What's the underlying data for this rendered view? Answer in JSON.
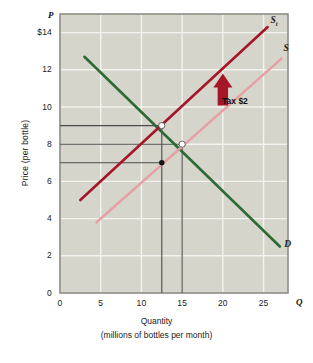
{
  "figure": {
    "axis_letters": {
      "y": "P",
      "x": "Q"
    },
    "y_axis_title": "Price (per bottle)",
    "x_axis_title": "Quantity",
    "x_axis_subtitle": "(millions of bottles per month)"
  },
  "colors": {
    "demand": "#2e6b33",
    "supply_tax": "#a51728",
    "supply": "#e5a2a6",
    "plot_background": "#d6d5cc",
    "gridline": "#f2f2ee",
    "axis_frame": "#8e8e88",
    "guide_line": "#4b4b4b",
    "text": "#1a1a1a"
  },
  "chart_data": {
    "type": "line",
    "title": "",
    "xlabel": "Quantity (millions of bottles per month)",
    "ylabel": "Price (per bottle)",
    "xlim": [
      0,
      28
    ],
    "ylim": [
      0,
      15
    ],
    "grid": true,
    "legend": "inline-curve-labels",
    "x_ticks": [
      0,
      5,
      10,
      15,
      20,
      25
    ],
    "x_tick_labels": [
      "0",
      "5",
      "10",
      "15",
      "20",
      "25"
    ],
    "y_ticks": [
      0,
      2,
      4,
      6,
      8,
      10,
      12,
      14
    ],
    "y_tick_labels": [
      "0",
      "2",
      "4",
      "6",
      "8",
      "10",
      "12",
      "$14"
    ],
    "series": [
      {
        "name": "D",
        "label": "D",
        "color": "#2e6b33",
        "points": [
          [
            3,
            12.7
          ],
          [
            27,
            2.5
          ]
        ],
        "label_at": [
          27.3,
          2.6
        ]
      },
      {
        "name": "St",
        "label": "S",
        "sublabel": "t",
        "color": "#a51728",
        "points": [
          [
            2.5,
            5.0
          ],
          [
            25.5,
            14.3
          ]
        ],
        "label_at": [
          25.6,
          14.6
        ]
      },
      {
        "name": "S",
        "label": "S",
        "color": "#e5a2a6",
        "points": [
          [
            4.5,
            3.8
          ],
          [
            27.2,
            12.6
          ]
        ],
        "label_at": [
          27.2,
          13.1
        ]
      }
    ],
    "markers": [
      {
        "name": "equilibrium-with-tax",
        "x": 12.5,
        "y": 9,
        "style": "open-circle"
      },
      {
        "name": "equilibrium-no-tax",
        "x": 15,
        "y": 8,
        "style": "open-circle"
      },
      {
        "name": "price-received-by-seller",
        "x": 12.5,
        "y": 7,
        "style": "filled-dot"
      }
    ],
    "guide_lines": [
      {
        "name": "price-9-line",
        "type": "horizontal",
        "y": 9,
        "from_x": 0,
        "to_x": 12.5
      },
      {
        "name": "price-8-line",
        "type": "horizontal",
        "y": 8,
        "from_x": 0,
        "to_x": 15
      },
      {
        "name": "price-7-line",
        "type": "horizontal",
        "y": 7,
        "from_x": 0,
        "to_x": 12.5
      },
      {
        "name": "quantity-12.5-line",
        "type": "vertical",
        "x": 12.5,
        "from_y": 0,
        "to_y": 9
      },
      {
        "name": "quantity-15-line",
        "type": "vertical",
        "x": 15,
        "from_y": 0,
        "to_y": 8
      }
    ],
    "annotations": [
      {
        "name": "tax-annotation",
        "text": "Tax $2",
        "arrow": "up",
        "arrow_color": "#a51728",
        "arrow_at": [
          20,
          11
        ]
      }
    ]
  }
}
